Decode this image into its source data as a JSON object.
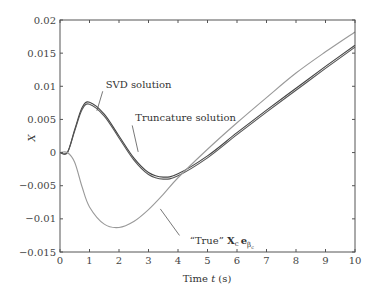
{
  "chart_data": {
    "type": "line",
    "title": "",
    "xlabel_prefix": "Time ",
    "xlabel_var": "t",
    "xlabel_suffix": " (s)",
    "ylabel": "X",
    "xlim": [
      0,
      10
    ],
    "ylim": [
      -0.015,
      0.02
    ],
    "grid": false,
    "legend": "none (inline annotations)",
    "xticks": [
      "0",
      "1",
      "2",
      "3",
      "4",
      "5",
      "6",
      "7",
      "8",
      "9",
      "10"
    ],
    "yticks": [
      "0.02",
      "0.015",
      "0.01",
      "0.005",
      "0",
      "−0.005",
      "−0.01",
      "−0.015"
    ],
    "x": [
      0,
      0.25,
      0.5,
      0.75,
      1.0,
      1.5,
      2.0,
      2.5,
      3.0,
      3.5,
      4.0,
      5.0,
      6.0,
      7.0,
      8.0,
      9.0,
      10.0
    ],
    "series": [
      {
        "name": "SVD solution",
        "color": "#444444",
        "values": [
          0,
          0,
          0.0035,
          0.0068,
          0.0076,
          0.0058,
          0.0025,
          -0.0008,
          -0.003,
          -0.0037,
          -0.0032,
          -0.0005,
          0.003,
          0.0064,
          0.0097,
          0.013,
          0.0162
        ]
      },
      {
        "name": "Truncature solution",
        "color": "#555555",
        "values": [
          0,
          0,
          0.0033,
          0.0065,
          0.0073,
          0.0055,
          0.0022,
          -0.0011,
          -0.0033,
          -0.004,
          -0.0035,
          -0.0008,
          0.0027,
          0.0061,
          0.0094,
          0.0127,
          0.0159
        ]
      },
      {
        "name": "\"True\" Xc eβc",
        "color": "#999999",
        "values": [
          0,
          0,
          -0.0015,
          -0.0052,
          -0.0082,
          -0.0108,
          -0.0113,
          -0.0104,
          -0.0086,
          -0.0063,
          -0.0038,
          0.0005,
          0.0045,
          0.0083,
          0.012,
          0.0152,
          0.0182
        ]
      }
    ],
    "annotations": [
      {
        "text": "SVD solution",
        "x": 1.55,
        "y": 0.0097
      },
      {
        "text": "Truncature solution",
        "x": 2.55,
        "y": 0.0047
      },
      {
        "text": "\"True\" ",
        "bold_part": "X",
        "sub1": "c",
        "bold_part2": "e",
        "sub2": "β",
        "sub3": "c",
        "x": 4.4,
        "y": -0.0138
      }
    ]
  }
}
